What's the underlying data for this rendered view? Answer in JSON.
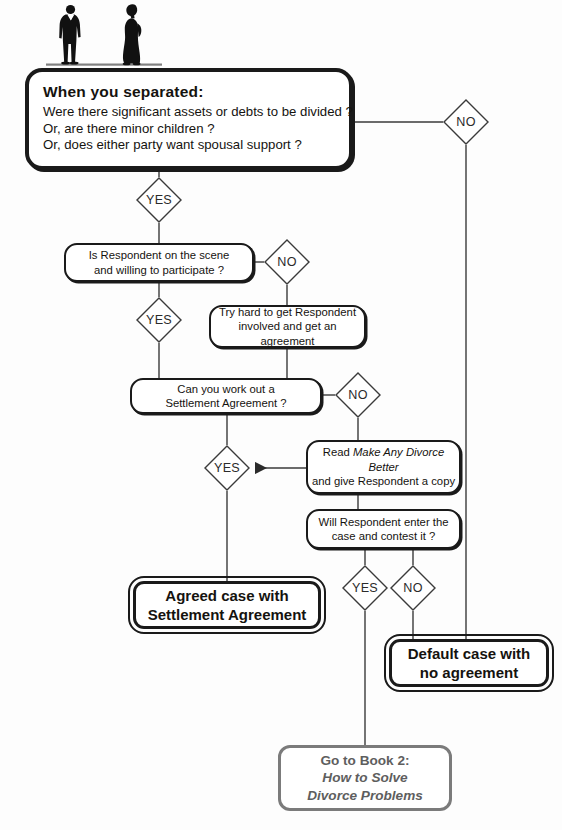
{
  "figure": {
    "type": "flowchart",
    "people_icon": "two-person-silhouette-icon"
  },
  "colors": {
    "ink": "#1a1a1a",
    "line": "#3a3a3a",
    "gray_accent": "#7b7b7b",
    "page": "#fdfdfd"
  },
  "nodes": {
    "separated": {
      "title": "When you separated:",
      "line1": "Were there significant assets or debts to be divided ?",
      "line2": "Or, are there minor children ?",
      "line3": "Or, does either party want spousal support ?"
    },
    "respondent_scene": {
      "line1": "Is Respondent on the scene",
      "line2": "and willing to participate ?"
    },
    "try_hard": {
      "line1": "Try hard to get Respondent",
      "line2": "involved and get an agreement"
    },
    "work_out": {
      "line1": "Can you work out a",
      "line2": "Settlement Agreement ?"
    },
    "read_book": {
      "line1_pre": "Read ",
      "line1_italic": "Make Any Divorce Better",
      "line2": "and give Respondent a copy"
    },
    "will_contest": {
      "line1": "Will Respondent enter the",
      "line2": "case and contest it ?"
    },
    "agreed_case": {
      "line1": "Agreed case with",
      "line2": "Settlement Agreement"
    },
    "default_case": {
      "line1": "Default case with",
      "line2": "no agreement"
    },
    "book2": {
      "line1": "Go to Book 2:",
      "line2": "How to Solve",
      "line3": "Divorce Problems"
    }
  },
  "decisions": {
    "sep_no": "NO",
    "sep_yes": "YES",
    "scene_no": "NO",
    "scene_yes": "YES",
    "workout_no": "NO",
    "workout_yes": "YES",
    "contest_yes": "YES",
    "contest_no": "NO"
  }
}
